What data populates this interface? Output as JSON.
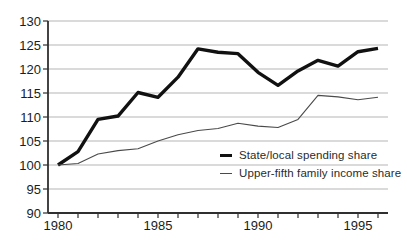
{
  "chart_data": {
    "type": "line",
    "title": "",
    "xlabel": "",
    "ylabel": "",
    "ylim": [
      90,
      130
    ],
    "y_ticks": [
      90,
      95,
      100,
      105,
      110,
      115,
      120,
      125,
      130
    ],
    "x": [
      1980,
      1981,
      1982,
      1983,
      1984,
      1985,
      1986,
      1987,
      1988,
      1989,
      1990,
      1991,
      1992,
      1993,
      1994,
      1995,
      1996
    ],
    "x_label_years": [
      1980,
      1985,
      1990,
      1995
    ],
    "grid": "horizontal",
    "legend_position": "inside-bottom-right",
    "series": [
      {
        "name": "State/local spending share",
        "style": "thick",
        "color": "#111111",
        "width": 3.4,
        "values": [
          100,
          102.8,
          109.5,
          110.2,
          115.1,
          114.1,
          118.3,
          124.2,
          123.5,
          123.2,
          119.3,
          116.6,
          119.6,
          121.8,
          120.6,
          123.6,
          124.3
        ]
      },
      {
        "name": "Upper-fifth family income share",
        "style": "thin",
        "color": "#4a4a4a",
        "width": 1.1,
        "values": [
          100,
          100.3,
          102.3,
          103,
          103.4,
          105,
          106.3,
          107.2,
          107.6,
          108.7,
          108.1,
          107.8,
          109.5,
          114.5,
          114.2,
          113.6,
          114.1
        ]
      }
    ]
  },
  "colors": {
    "background": "#ffffff",
    "grid": "#b5b5b5",
    "axis": "#2f2f2f",
    "tick_label": "#1c1c1c"
  }
}
